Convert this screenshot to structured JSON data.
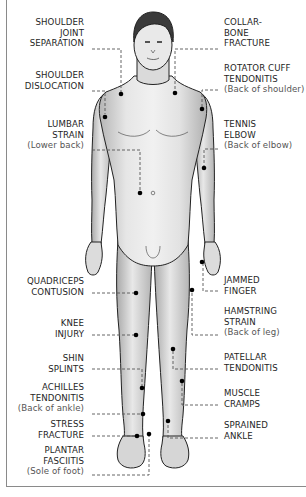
{
  "diagram": {
    "colors": {
      "background": "#ffffff",
      "frame": "#8a8a8a",
      "label_text": "#1e1e1e",
      "sub_text": "#555555",
      "leader_line": "#555555",
      "marker_dot": "#000000",
      "skin_light": "#ececec",
      "skin_shade": "#b9b9b9",
      "hair": "#3a3a3a"
    },
    "left_labels": [
      {
        "id": "shoulder-joint-separation",
        "lines": [
          "SHOULDER",
          "JOINT",
          "SEPARATION"
        ],
        "sub": ""
      },
      {
        "id": "shoulder-dislocation",
        "lines": [
          "SHOULDER",
          "DISLOCATION"
        ],
        "sub": ""
      },
      {
        "id": "lumbar-strain",
        "lines": [
          "LUMBAR",
          "STRAIN"
        ],
        "sub": "(Lower back)"
      },
      {
        "id": "quadriceps-contusion",
        "lines": [
          "QUADRICEPS",
          "CONTUSION"
        ],
        "sub": ""
      },
      {
        "id": "knee-injury",
        "lines": [
          "KNEE",
          "INJURY"
        ],
        "sub": ""
      },
      {
        "id": "shin-splints",
        "lines": [
          "SHIN",
          "SPLINTS"
        ],
        "sub": ""
      },
      {
        "id": "achilles-tendonitis",
        "lines": [
          "ACHILLES",
          "TENDONITIS"
        ],
        "sub": "(Back of ankle)"
      },
      {
        "id": "stress-fracture",
        "lines": [
          "STRESS",
          "FRACTURE"
        ],
        "sub": ""
      },
      {
        "id": "plantar-fasciitis",
        "lines": [
          "PLANTAR",
          "FASCIITIS"
        ],
        "sub": "(Sole of foot)"
      }
    ],
    "right_labels": [
      {
        "id": "collarbone-fracture",
        "lines": [
          "COLLAR-",
          "BONE",
          "FRACTURE"
        ],
        "sub": ""
      },
      {
        "id": "rotator-cuff-tendonitis",
        "lines": [
          "ROTATOR CUFF",
          "TENDONITIS"
        ],
        "sub": "(Back of shoulder)"
      },
      {
        "id": "tennis-elbow",
        "lines": [
          "TENNIS",
          "ELBOW"
        ],
        "sub": "(Back of elbow)"
      },
      {
        "id": "jammed-finger",
        "lines": [
          "JAMMED",
          "FINGER"
        ],
        "sub": ""
      },
      {
        "id": "hamstring-strain",
        "lines": [
          "HAMSTRING",
          "STRAIN"
        ],
        "sub": "(Back of leg)"
      },
      {
        "id": "patellar-tendonitis",
        "lines": [
          "PATELLAR",
          "TENDONITIS"
        ],
        "sub": ""
      },
      {
        "id": "muscle-cramps",
        "lines": [
          "MUSCLE",
          "CRAMPS"
        ],
        "sub": ""
      },
      {
        "id": "sprained-ankle",
        "lines": [
          "SPRAINED",
          "ANKLE"
        ],
        "sub": ""
      }
    ]
  }
}
